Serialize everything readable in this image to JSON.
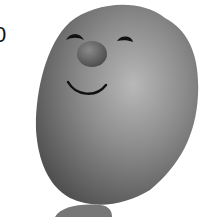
{
  "image": {
    "description": "Grayscale photo of a round clay toy face with two eyes, nose, and smile",
    "partial_text": "0",
    "colors": {
      "background": "#ffffff",
      "body": "#8a8a8a",
      "body_highlight": "#b4b4b4",
      "body_shadow": "#555555",
      "nose": "#6e6e6e",
      "features": "#111111"
    }
  }
}
